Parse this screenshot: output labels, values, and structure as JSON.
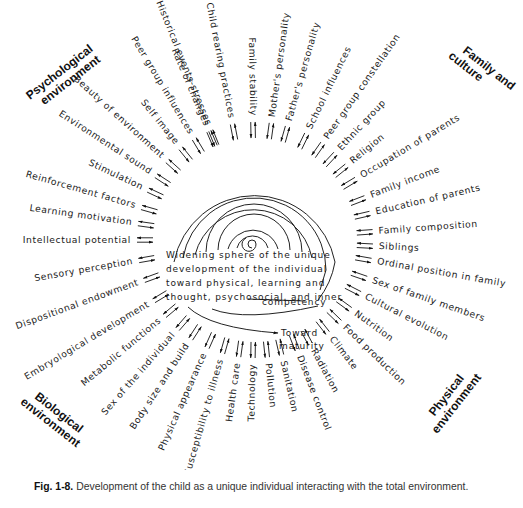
{
  "sections": {
    "psychological": [
      "Psychological",
      "environment"
    ],
    "family": [
      "Family and",
      "culture"
    ],
    "biological": [
      "Biological",
      "environment"
    ],
    "physical": [
      "Physical",
      "environment"
    ]
  },
  "center": {
    "lines": [
      "Widening sphere of the unique",
      "development of the individual",
      "toward physical, learning and",
      "thought, psychosocial, and inner",
      "competency"
    ],
    "toward": [
      "Toward",
      "maturity"
    ]
  },
  "factors": [
    {
      "label": "Historical events-stresses",
      "angle": -112
    },
    {
      "label": "Child rearing practices",
      "angle": -101
    },
    {
      "label": "Family stability",
      "angle": -91
    },
    {
      "label": "Mother's personality",
      "angle": -82
    },
    {
      "label": "Father's personality",
      "angle": -74
    },
    {
      "label": "School influences",
      "angle": -64
    },
    {
      "label": "Peer group constellation",
      "angle": -55
    },
    {
      "label": "Ethnic group",
      "angle": -47
    },
    {
      "label": "Religion",
      "angle": -39
    },
    {
      "label": "Occupation of parents",
      "angle": -31
    },
    {
      "label": "Family income",
      "angle": -21
    },
    {
      "label": "Education of parents",
      "angle": -13
    },
    {
      "label": "Family composition",
      "angle": -4
    },
    {
      "label": "Siblings",
      "angle": 3
    },
    {
      "label": "Ordinal position in family",
      "angle": 10
    },
    {
      "label": "Sex of family members",
      "angle": 19
    },
    {
      "label": "Cultural evolution",
      "angle": 27
    },
    {
      "label": "Nutrition",
      "angle": 36
    },
    {
      "label": "Food production",
      "angle": 44
    },
    {
      "label": "Climate",
      "angle": 52
    },
    {
      "label": "Radiation",
      "angle": 62
    },
    {
      "label": "Disease control",
      "angle": 69
    },
    {
      "label": "Sanitation",
      "angle": 77
    },
    {
      "label": "Pollution",
      "angle": 84
    },
    {
      "label": "Technology",
      "angle": 91
    },
    {
      "label": "Health care",
      "angle": 98
    },
    {
      "label": "Susceptibility to illness",
      "angle": 106
    },
    {
      "label": "Physical appearance",
      "angle": 114
    },
    {
      "label": "Body size and build",
      "angle": 123
    },
    {
      "label": "Sex of the individual",
      "angle": 131
    },
    {
      "label": "Metabolic functions",
      "angle": 140
    },
    {
      "label": "Embryological development",
      "angle": 149
    },
    {
      "label": "Dispositional endowment",
      "angle": 160
    },
    {
      "label": "Sensory perception",
      "angle": 170
    },
    {
      "label": "Intellectual potential",
      "angle": 180
    },
    {
      "label": "Learning motivation",
      "angle": 188
    },
    {
      "label": "Reinforcement factors",
      "angle": 196
    },
    {
      "label": "Stimulation",
      "angle": 205
    },
    {
      "label": "Environmental sound",
      "angle": 213
    },
    {
      "label": "Beauty of environment",
      "angle": 222
    },
    {
      "label": "Self image",
      "angle": 231
    },
    {
      "label": "Peer group influences",
      "angle": 239
    },
    {
      "label": "Rate of changes",
      "angle": 247
    }
  ],
  "caption": {
    "fig": "Fig. 1-8.",
    "text": "Development of the child as a unique individual interacting with the total environment."
  }
}
